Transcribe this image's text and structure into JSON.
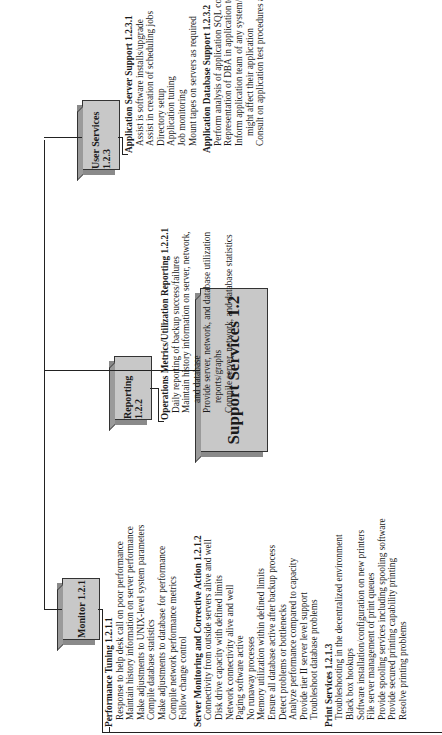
{
  "root": {
    "label": "Support Services 1.2"
  },
  "branches": [
    {
      "label": "Monitor 1.2.1",
      "sections": [
        {
          "title": "Performance Tuning  1.2.1.1",
          "items": [
            "Response to help desk call on poor performance",
            "Maintain history information on server performance",
            "Make adjustments to UNIX-level system parameters",
            "Compile database statistics",
            "Make adjustments to database for performance",
            "Compile network performance metrics",
            "Follow change control"
          ]
        },
        {
          "title": "Server Monitoring and Corrective Action  1.2.1.2",
          "items": [
            "Connectivity from outside servers alive and well",
            "Disk drive capacity with defined limits",
            "Network connectivity alive and well",
            "Paging software active",
            "No runaway processes",
            "Memory utilization within defined limits",
            "Ensure all database active after backup process",
            "Detect problems or bottlenecks",
            "Analyze performance compared to capacity",
            "Provide tier II server level support",
            "Troubleshoot database problems"
          ]
        },
        {
          "title": "Print Services 1.2.1.3",
          "items": [
            "Troubleshooting in the decentralized environment",
            "Black box hookups",
            "Software installation/configuration on new printers",
            "File server management of print queues",
            "Provide spooling services including spooling software",
            "Provide secured printing capability printing",
            "Resolve printing problems"
          ]
        }
      ]
    },
    {
      "label": "Reporting 1.2.2",
      "sections": [
        {
          "title": "Operations Metrics/Utilization Reporting  1.2.2.1",
          "items": [
            "Daily reporting of backup success/failures",
            "Maintain history information on server, network,",
            "and database",
            "Provide server, network, and database utilization",
            "reports/graphs",
            "Compile server, network, and database statistics"
          ]
        }
      ]
    },
    {
      "label": "User Services  1.2.3",
      "sections": [
        {
          "title": "Application Server Support 1.2.3.1",
          "items": [
            "Assist is software installs/upgrade",
            "Assist in creation of scheduling jobs",
            "Directory setup",
            "Application tuning",
            "Job monitoring",
            "Mount tapes on servers as required"
          ]
        },
        {
          "title": "Application Database Support 1.2.3.2",
          "items": [
            "Perform analysis of application SQL code when requested",
            "Representation of DBA in application team meetings",
            "Inform application team of any system/database changes that",
            "might affect their application",
            "Consult on application test procedures and test evaluation plan"
          ]
        }
      ]
    }
  ]
}
